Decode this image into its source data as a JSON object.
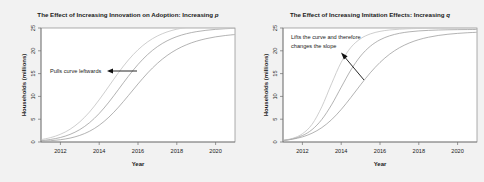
{
  "figure": {
    "background_color": "#f2f2f2",
    "plot_background_color": "#ffffff",
    "frame_color": "#8a8a8a"
  },
  "chart_data": [
    {
      "type": "line",
      "panel": "left",
      "title": "The Effect of Increasing Innovation on Adoption: Increasing ",
      "title_italic_suffix": "p",
      "xlabel": "Year",
      "ylabel": "Households (millions)",
      "xlim": [
        2011,
        2021
      ],
      "ylim": [
        0,
        25
      ],
      "xticks": [
        2012,
        2014,
        2016,
        2018,
        2020
      ],
      "xtick_labels": [
        "2012",
        "2014",
        "2016",
        "2018",
        "2020"
      ],
      "yticks": [
        0,
        5,
        10,
        15,
        20,
        25
      ],
      "ytick_labels": [
        "0",
        "5",
        "10",
        "15",
        "20",
        "25"
      ],
      "grid": false,
      "legend": "none",
      "x": [
        2011,
        2011.5,
        2012,
        2012.5,
        2013,
        2013.5,
        2014,
        2014.5,
        2015,
        2015.5,
        2016,
        2016.5,
        2017,
        2017.5,
        2018,
        2018.5,
        2019,
        2019.5,
        2020,
        2020.5,
        2021
      ],
      "series": [
        {
          "name": "p = 0.010 (lowest innovation)",
          "color": "#9a9a9a",
          "values": [
            0.15,
            0.28,
            0.5,
            0.86,
            1.45,
            2.35,
            3.67,
            5.45,
            7.66,
            10.16,
            12.73,
            15.15,
            17.25,
            18.97,
            20.31,
            21.33,
            22.09,
            22.65,
            23.06,
            23.35,
            23.57
          ]
        },
        {
          "name": "p = 0.020 (medium innovation)",
          "color": "#9a9a9a",
          "values": [
            0.3,
            0.56,
            0.99,
            1.67,
            2.72,
            4.23,
            6.25,
            8.75,
            11.56,
            14.4,
            17.0,
            19.19,
            20.91,
            22.19,
            23.11,
            23.75,
            24.19,
            24.49,
            24.7,
            24.84,
            24.93
          ]
        },
        {
          "name": "p = 0.035 (highest innovation)",
          "color": "#bdbdbd",
          "values": [
            0.52,
            0.97,
            1.69,
            2.8,
            4.41,
            6.58,
            9.26,
            12.24,
            15.24,
            17.96,
            20.22,
            21.97,
            23.25,
            24.14,
            24.74,
            25.13,
            25.38,
            25.54,
            25.63,
            25.69,
            25.73
          ]
        }
      ],
      "annotation": {
        "text": "Pulls curve leftwards",
        "arrow": "left-horizontal"
      }
    },
    {
      "type": "line",
      "panel": "right",
      "title": "The Effect of Increasing Imitation Effects: Increasing ",
      "title_italic_suffix": "q",
      "xlabel": "Year",
      "ylabel": "Households (millions)",
      "xlim": [
        2011,
        2021
      ],
      "ylim": [
        0,
        25
      ],
      "xticks": [
        2012,
        2014,
        2016,
        2018,
        2020
      ],
      "xtick_labels": [
        "2012",
        "2014",
        "2016",
        "2018",
        "2020"
      ],
      "yticks": [
        0,
        5,
        10,
        15,
        20,
        25
      ],
      "ytick_labels": [
        "0",
        "5",
        "10",
        "15",
        "20",
        "25"
      ],
      "grid": false,
      "legend": "none",
      "x": [
        2011,
        2011.5,
        2012,
        2012.5,
        2013,
        2013.5,
        2014,
        2014.5,
        2015,
        2015.5,
        2016,
        2016.5,
        2017,
        2017.5,
        2018,
        2018.5,
        2019,
        2019.5,
        2020,
        2020.5,
        2021
      ],
      "series": [
        {
          "name": "q = 0.35 (lowest imitation)",
          "color": "#9a9a9a",
          "values": [
            0.32,
            0.62,
            1.12,
            1.93,
            3.15,
            4.88,
            7.13,
            9.77,
            12.55,
            15.18,
            17.45,
            19.27,
            20.67,
            21.7,
            22.45,
            22.98,
            23.36,
            23.63,
            23.82,
            23.96,
            24.06
          ]
        },
        {
          "name": "q = 0.55 (medium imitation)",
          "color": "#9a9a9a",
          "values": [
            0.33,
            0.7,
            1.41,
            2.72,
            4.94,
            8.14,
            12.0,
            15.8,
            18.85,
            21.0,
            22.41,
            23.29,
            23.83,
            24.16,
            24.36,
            24.48,
            24.56,
            24.61,
            24.64,
            24.66,
            24.67
          ]
        },
        {
          "name": "q = 0.80 (highest imitation)",
          "color": "#bdbdbd",
          "values": [
            0.35,
            0.8,
            1.8,
            3.89,
            7.72,
            12.75,
            17.49,
            20.75,
            22.66,
            23.7,
            24.26,
            24.57,
            24.74,
            24.84,
            24.9,
            24.93,
            24.95,
            24.96,
            24.97,
            24.98,
            24.98
          ]
        }
      ],
      "annotation": {
        "text_line1": "Lifts the curve and therefore",
        "text_line2": "changes the slope",
        "arrow": "up-left-diagonal"
      }
    }
  ]
}
